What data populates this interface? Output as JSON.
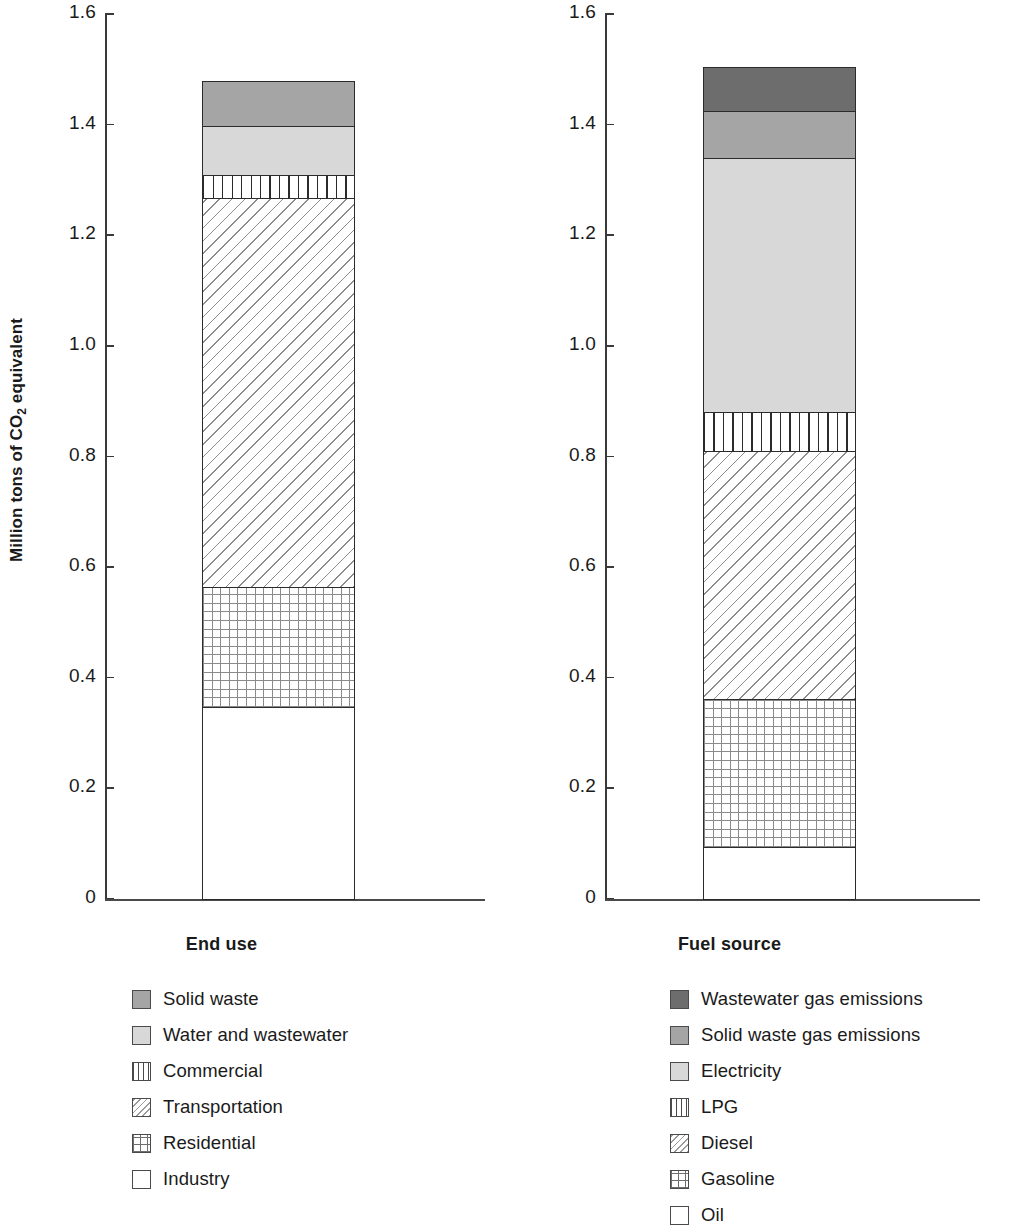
{
  "chart_data": [
    {
      "type": "bar",
      "title": "End use",
      "xlabel": "",
      "ylabel": "Million tons of CO2 equivalent",
      "ylim": [
        0,
        1.6
      ],
      "ytick_labels": [
        "1.6",
        "1.4",
        "1.2",
        "1.0",
        "0.8",
        "0.6",
        "0.4",
        "0.2",
        "0"
      ],
      "yticks": [
        1.6,
        1.4,
        1.2,
        1.0,
        0.8,
        0.6,
        0.4,
        0.2,
        0
      ],
      "grid": false,
      "legend_position": "below",
      "stacked": true,
      "categories": [
        "End use"
      ],
      "total": 1.48,
      "series": [
        {
          "name": "Industry",
          "values": [
            0.347
          ],
          "cum_top": 0.347,
          "fill": "white"
        },
        {
          "name": "Residential",
          "values": [
            0.218
          ],
          "cum_top": 0.565,
          "fill": "grid"
        },
        {
          "name": "Transportation",
          "values": [
            0.704
          ],
          "cum_top": 1.269,
          "fill": "diagonal"
        },
        {
          "name": "Commercial",
          "values": [
            0.041
          ],
          "cum_top": 1.31,
          "fill": "vertical-lines"
        },
        {
          "name": "Water and wastewater",
          "values": [
            0.089
          ],
          "cum_top": 1.399,
          "fill": "light-gray"
        },
        {
          "name": "Solid waste",
          "values": [
            0.081
          ],
          "cum_top": 1.48,
          "fill": "medium-gray"
        }
      ]
    },
    {
      "type": "bar",
      "title": "Fuel source",
      "xlabel": "",
      "ylabel": "Million tons of CO2 equivalent",
      "ylim": [
        0,
        1.6
      ],
      "ytick_labels": [
        "1.6",
        "1.4",
        "1.2",
        "1.0",
        "0.8",
        "0.6",
        "0.4",
        "0.2",
        "0"
      ],
      "yticks": [
        1.6,
        1.4,
        1.2,
        1.0,
        0.8,
        0.6,
        0.4,
        0.2,
        0
      ],
      "grid": false,
      "legend_position": "below",
      "stacked": true,
      "categories": [
        "Fuel source"
      ],
      "total": 1.505,
      "series": [
        {
          "name": "Oil",
          "values": [
            0.095
          ],
          "cum_top": 0.095,
          "fill": "white"
        },
        {
          "name": "Gasoline",
          "values": [
            0.267
          ],
          "cum_top": 0.362,
          "fill": "grid"
        },
        {
          "name": "Diesel",
          "values": [
            0.449
          ],
          "cum_top": 0.811,
          "fill": "diagonal"
        },
        {
          "name": "LPG",
          "values": [
            0.07
          ],
          "cum_top": 0.881,
          "fill": "vertical-lines"
        },
        {
          "name": "Electricity",
          "values": [
            0.459
          ],
          "cum_top": 1.34,
          "fill": "light-gray"
        },
        {
          "name": "Solid waste gas emissions",
          "values": [
            0.085
          ],
          "cum_top": 1.425,
          "fill": "medium-gray"
        },
        {
          "name": "Wastewater gas emissions",
          "values": [
            0.08
          ],
          "cum_top": 1.505,
          "fill": "dark-gray"
        }
      ]
    }
  ],
  "axis": {
    "y_title_main": "Million tons of CO",
    "y_title_sub": "2",
    "y_title_tail": " equivalent",
    "tick_labels": [
      "1.6",
      "1.4",
      "1.2",
      "1.0",
      "0.8",
      "0.6",
      "0.4",
      "0.2",
      "0"
    ]
  },
  "left_chart": {
    "caption": "End use",
    "legend": [
      {
        "label": "Solid waste",
        "fill": "medium-gray"
      },
      {
        "label": "Water and wastewater",
        "fill": "light-gray"
      },
      {
        "label": "Commercial",
        "fill": "vertical-lines"
      },
      {
        "label": "Transportation",
        "fill": "diagonal"
      },
      {
        "label": "Residential",
        "fill": "grid"
      },
      {
        "label": "Industry",
        "fill": "white"
      }
    ]
  },
  "right_chart": {
    "caption": "Fuel source",
    "legend": [
      {
        "label": "Wastewater gas emissions",
        "fill": "dark-gray"
      },
      {
        "label": "Solid waste gas emissions",
        "fill": "medium-gray"
      },
      {
        "label": "Electricity",
        "fill": "light-gray"
      },
      {
        "label": "LPG",
        "fill": "vertical-lines"
      },
      {
        "label": "Diesel",
        "fill": "diagonal"
      },
      {
        "label": "Gasoline",
        "fill": "grid"
      },
      {
        "label": "Oil",
        "fill": "white"
      }
    ]
  },
  "colors": {
    "dark_gray": "#6d6d6d",
    "medium_gray": "#a5a5a5",
    "light_gray": "#d8d8d8",
    "outline": "#2b2b2b",
    "axis": "#3a3a3a"
  }
}
